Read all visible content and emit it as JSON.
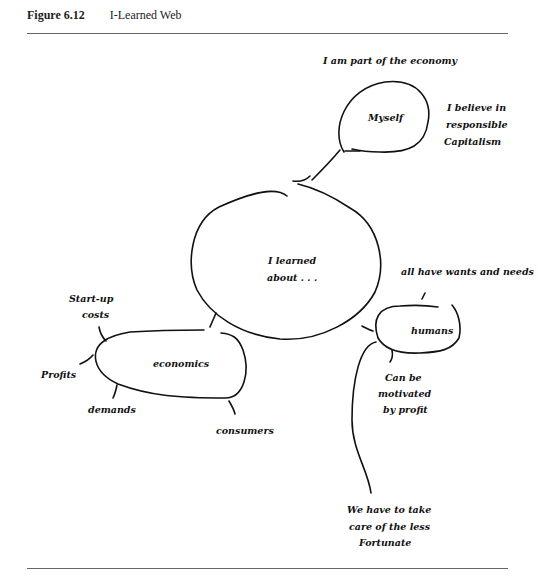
{
  "figure": {
    "number": "Figure 6.12",
    "title": "I-Learned Web"
  },
  "nodes": {
    "center": "I learned about . . .",
    "center_line1": "I learned",
    "center_line2": "about . . .",
    "myself": "Myself",
    "economics": "economics",
    "humans": "humans"
  },
  "branches": {
    "myself": {
      "part_of_economy": "I am part of the economy",
      "believe_1": "I believe in",
      "believe_2": "responsible",
      "believe_3": "Capitalism"
    },
    "economics": {
      "startup_1": "Start-up",
      "startup_2": "costs",
      "profits": "Profits",
      "demands": "demands",
      "consumers": "consumers"
    },
    "humans": {
      "wants_needs": "all have wants and needs",
      "motivated_1": "Can be",
      "motivated_2": "motivated",
      "motivated_3": "by profit",
      "fortunate_1": "We have to take",
      "fortunate_2": "care of the less",
      "fortunate_3": "Fortunate"
    }
  }
}
